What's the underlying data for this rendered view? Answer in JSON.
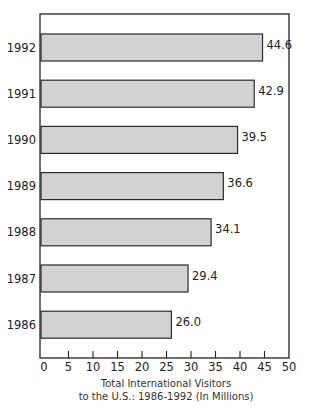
{
  "chart_data": {
    "type": "bar",
    "orientation": "horizontal",
    "categories": [
      "1992",
      "1991",
      "1990",
      "1989",
      "1988",
      "1987",
      "1986"
    ],
    "values": [
      44.6,
      42.9,
      39.5,
      36.6,
      34.1,
      29.4,
      26.0
    ],
    "value_labels": [
      "44.6",
      "42.9",
      "39.5",
      "36.6",
      "34.1",
      "29.4",
      "26.0"
    ],
    "title": "",
    "xlabel": "Total International Visitors to the U.S.: 1986-1992 (In Millions)",
    "xlabel_lines": [
      "Total International Visitors",
      "to the U.S.: 1986-1992 (In Millions)"
    ],
    "ylabel": "",
    "xlim": [
      0,
      50
    ],
    "xticks": [
      0,
      5,
      10,
      15,
      20,
      25,
      30,
      35,
      40,
      45,
      50
    ],
    "grid": false,
    "legend": null,
    "colors": {
      "bar_fill": "#d2d2d2",
      "bar_stroke": "#2a2a2a",
      "axis": "#222222"
    }
  }
}
